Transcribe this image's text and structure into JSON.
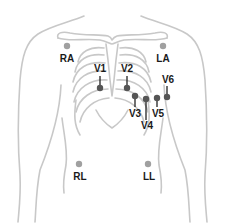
{
  "diagram": {
    "type": "ecg-electrode-placement",
    "colors": {
      "outline": "#c8c8c8",
      "limb_dot": "#a0a0a0",
      "chest_dot": "#555555",
      "leader_line": "#222222",
      "label": "#1a1a1a"
    },
    "limb_leads": [
      {
        "id": "RA",
        "label": "RA",
        "dot": [
          67,
          46
        ],
        "label_pos": [
          67,
          59
        ]
      },
      {
        "id": "LA",
        "label": "LA",
        "dot": [
          163,
          46
        ],
        "label_pos": [
          163,
          59
        ]
      },
      {
        "id": "RL",
        "label": "RL",
        "dot": [
          79,
          164
        ],
        "label_pos": [
          80,
          177
        ]
      },
      {
        "id": "LL",
        "label": "LL",
        "dot": [
          148,
          164
        ],
        "label_pos": [
          149,
          177
        ]
      }
    ],
    "chest_leads": [
      {
        "id": "V1",
        "label": "V1",
        "dot": [
          100,
          88
        ],
        "label_pos": [
          100,
          69
        ],
        "line": [
          100,
          76,
          100,
          86
        ]
      },
      {
        "id": "V2",
        "label": "V2",
        "dot": [
          127,
          88
        ],
        "label_pos": [
          127,
          69
        ],
        "line": [
          127,
          76,
          127,
          86
        ]
      },
      {
        "id": "V3",
        "label": "V3",
        "dot": [
          135,
          96
        ],
        "label_pos": [
          135,
          114
        ],
        "line": [
          135,
          98,
          135,
          107
        ]
      },
      {
        "id": "V4",
        "label": "V4",
        "dot": [
          146,
          99
        ],
        "label_pos": [
          147,
          126
        ],
        "line": [
          146,
          101,
          146,
          120
        ]
      },
      {
        "id": "V5",
        "label": "V5",
        "dot": [
          157,
          98
        ],
        "label_pos": [
          158,
          114
        ],
        "line": [
          157,
          100,
          157,
          107
        ]
      },
      {
        "id": "V6",
        "label": "V6",
        "dot": [
          167,
          97
        ],
        "label_pos": [
          168,
          80
        ],
        "line": [
          167,
          86,
          167,
          95
        ]
      }
    ]
  }
}
